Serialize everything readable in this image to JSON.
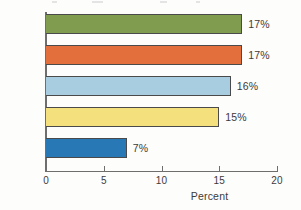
{
  "chart_data": {
    "type": "bar",
    "orientation": "horizontal",
    "title": "",
    "xlabel": "Percent",
    "ylabel": "",
    "xlim": [
      0,
      20
    ],
    "xticks": [
      "0",
      "5",
      "10",
      "15",
      "20"
    ],
    "grid": false,
    "legend": "none",
    "categories": [
      "Hispanic",
      "Black",
      "Total",
      "White",
      "Asian"
    ],
    "values": [
      17,
      17,
      16,
      15,
      7
    ],
    "value_labels": [
      "17%",
      "17%",
      "16%",
      "15%",
      "7%"
    ],
    "bar_colors": [
      "#7f9c4f",
      "#e3703c",
      "#a8cde0",
      "#f5e07e",
      "#2878b5"
    ],
    "bar_outline_color": "#4a4a4a",
    "axis_color": "#6e6e6e",
    "text_color": "#3b3b3b",
    "background_color": "#fdfdfc"
  },
  "axis": {
    "x_title": "Percent",
    "ticks": [
      {
        "label": "0",
        "value": 0
      },
      {
        "label": "5",
        "value": 5
      },
      {
        "label": "10",
        "value": 10
      },
      {
        "label": "15",
        "value": 15
      },
      {
        "label": "20",
        "value": 20
      }
    ]
  },
  "bars": [
    {
      "category": "Hispanic",
      "value": 17,
      "value_label": "17%",
      "color": "#7f9c4f"
    },
    {
      "category": "Black",
      "value": 17,
      "value_label": "17%",
      "color": "#e3703c"
    },
    {
      "category": "Total",
      "value": 16,
      "value_label": "16%",
      "color": "#a8cde0"
    },
    {
      "category": "White",
      "value": 15,
      "value_label": "15%",
      "color": "#f5e07e"
    },
    {
      "category": "Asian",
      "value": 7,
      "value_label": "7%",
      "color": "#2878b5"
    }
  ]
}
